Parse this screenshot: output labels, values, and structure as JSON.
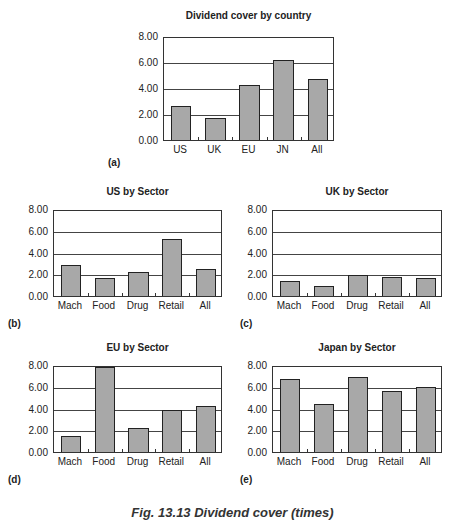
{
  "figure": {
    "caption": "Fig. 13.13 Dividend cover (times)"
  },
  "chart_data": [
    {
      "id": "a",
      "panel_label": "(a)",
      "type": "bar",
      "title": "Dividend cover by country",
      "categories": [
        "US",
        "UK",
        "EU",
        "JN",
        "All"
      ],
      "values": [
        2.7,
        1.7,
        4.35,
        6.25,
        4.8
      ],
      "yticks": [
        "8.00",
        "6.00",
        "4.00",
        "2.00",
        "0.00"
      ],
      "ylim": [
        0,
        8
      ],
      "grid": true,
      "xlabel": "",
      "ylabel": ""
    },
    {
      "id": "b",
      "panel_label": "(b)",
      "type": "bar",
      "title": "US by Sector",
      "categories": [
        "Mach",
        "Food",
        "Drug",
        "Retail",
        "All"
      ],
      "values": [
        2.9,
        1.7,
        2.25,
        5.4,
        2.5
      ],
      "yticks": [
        "8.00",
        "6.00",
        "4.00",
        "2.00",
        "0.00"
      ],
      "ylim": [
        0,
        8
      ],
      "grid": true,
      "xlabel": "",
      "ylabel": ""
    },
    {
      "id": "c",
      "panel_label": "(c)",
      "type": "bar",
      "title": "UK by Sector",
      "categories": [
        "Mach",
        "Food",
        "Drug",
        "Retail",
        "All"
      ],
      "values": [
        1.4,
        0.95,
        2.0,
        1.8,
        1.7
      ],
      "yticks": [
        "8.00",
        "6.00",
        "4.00",
        "2.00",
        "0.00"
      ],
      "ylim": [
        0,
        8
      ],
      "grid": true,
      "xlabel": "",
      "ylabel": ""
    },
    {
      "id": "d",
      "panel_label": "(d)",
      "type": "bar",
      "title": "EU by Sector",
      "categories": [
        "Mach",
        "Food",
        "Drug",
        "Retail",
        "All"
      ],
      "values": [
        1.5,
        8.0,
        2.3,
        4.0,
        4.35
      ],
      "yticks": [
        "8.00",
        "6.00",
        "4.00",
        "2.00",
        "0.00"
      ],
      "ylim": [
        0,
        8
      ],
      "grid": true,
      "xlabel": "",
      "ylabel": ""
    },
    {
      "id": "e",
      "panel_label": "(e)",
      "type": "bar",
      "title": "Japan by Sector",
      "categories": [
        "Mach",
        "Food",
        "Drug",
        "Retail",
        "All"
      ],
      "values": [
        6.85,
        4.55,
        7.05,
        5.7,
        6.1
      ],
      "yticks": [
        "8.00",
        "6.00",
        "4.00",
        "2.00",
        "0.00"
      ],
      "ylim": [
        0,
        8
      ],
      "grid": true,
      "xlabel": "",
      "ylabel": ""
    }
  ]
}
